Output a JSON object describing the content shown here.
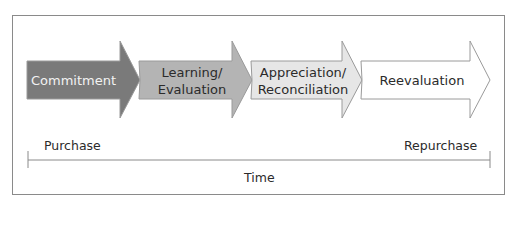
{
  "stages": [
    {
      "label_lines": [
        "Commitment"
      ],
      "fill": "#7a7a7a",
      "text_color": "#f2f2f2"
    },
    {
      "label_lines": [
        "Learning/",
        "Evaluation"
      ],
      "fill": "#b4b4b4",
      "text_color": "#2b2b2b"
    },
    {
      "label_lines": [
        "Appreciation/",
        "Reconciliation"
      ],
      "fill": "#e6e6e6",
      "text_color": "#2b2b2b"
    },
    {
      "label_lines": [
        "Reevaluation"
      ],
      "fill": "#ffffff",
      "text_color": "#2b2b2b"
    }
  ],
  "timeline": {
    "start_label": "Purchase",
    "end_label": "Repurchase",
    "axis_label": "Time"
  },
  "colors": {
    "outline": "#9a9a9a",
    "frame": "#8a8a8a",
    "axis": "#8a8a8a"
  }
}
